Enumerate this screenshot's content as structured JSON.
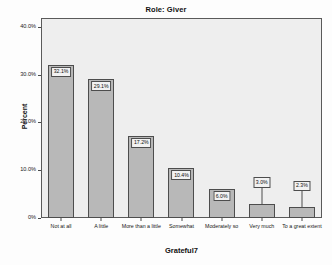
{
  "chart_data": {
    "type": "bar",
    "title": "Role: Giver",
    "xlabel": "Grateful7",
    "ylabel": "Percent",
    "categories": [
      "Not at all",
      "A little",
      "More than a little",
      "Somewhat",
      "Moderately so",
      "Very much",
      "To a great extent"
    ],
    "values": [
      32.1,
      29.1,
      17.2,
      10.4,
      6.0,
      3.0,
      2.3
    ],
    "value_labels": [
      "32.1%",
      "29.1%",
      "17.2%",
      "10.4%",
      "6.0%",
      "3.0%",
      "2.3%"
    ],
    "ylim": [
      0,
      42
    ],
    "yticks": [
      0,
      10,
      20,
      30,
      40
    ],
    "ytick_labels": [
      "0%",
      "10.0%",
      "20.0%",
      "30.0%",
      "40.0%"
    ],
    "grid": false,
    "legend": "none",
    "bar_color": "#b8b8b8",
    "bar_border_color": "#4d4d4d",
    "plot_background": "#eeeeee",
    "label_box_background": "#f2f2f2"
  }
}
